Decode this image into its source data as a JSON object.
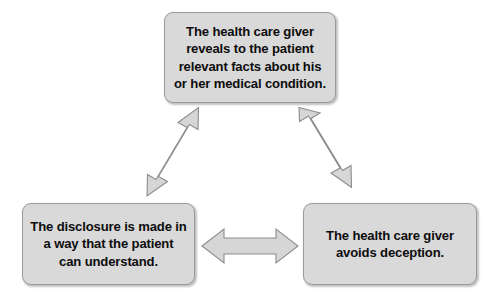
{
  "diagram": {
    "background_color": "#ffffff",
    "node_fill_color": "#d9d9d9",
    "node_border_color": "#9a9a9a",
    "arrow_fill_color": "#d6d6d6",
    "arrow_border_color": "#8c8c8c",
    "text_color": "#0d0d0d",
    "nodes": [
      {
        "id": "top",
        "label": "The health care giver\nreveals to the patient\nrelevant facts about his\nor her medical condition."
      },
      {
        "id": "bottom-left",
        "label": "The disclosure is made in\na way that the patient\ncan understand."
      },
      {
        "id": "bottom-right",
        "label": "The health care giver\navoids deception."
      }
    ],
    "connectors": [
      {
        "id": "left-diagonal",
        "icon": "double-headed-arrow-diagonal-up-right",
        "from": "bottom-left",
        "to": "top"
      },
      {
        "id": "right-diagonal",
        "icon": "double-headed-arrow-diagonal-up-left",
        "from": "bottom-right",
        "to": "top"
      },
      {
        "id": "bottom-horizontal",
        "icon": "double-headed-arrow-horizontal",
        "from": "bottom-left",
        "to": "bottom-right"
      }
    ]
  }
}
